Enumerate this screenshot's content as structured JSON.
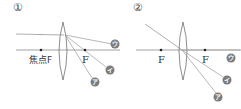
{
  "panels": [
    {
      "number": "①",
      "focal_labels": {
        "left": "焦点F",
        "right": "F"
      },
      "ray_labels": [
        "ウ",
        "イ",
        "ア"
      ]
    },
    {
      "number": "②",
      "focal_labels": {
        "left": "F",
        "right": "F"
      },
      "ray_labels": [
        "ウ",
        "イ",
        "ア"
      ]
    }
  ],
  "colors": {
    "axis": "#8a8a8a",
    "ray": "#9a9a9a",
    "lens": "#707070",
    "badge": "#7c7c7c",
    "focal_dot": "#222222"
  }
}
